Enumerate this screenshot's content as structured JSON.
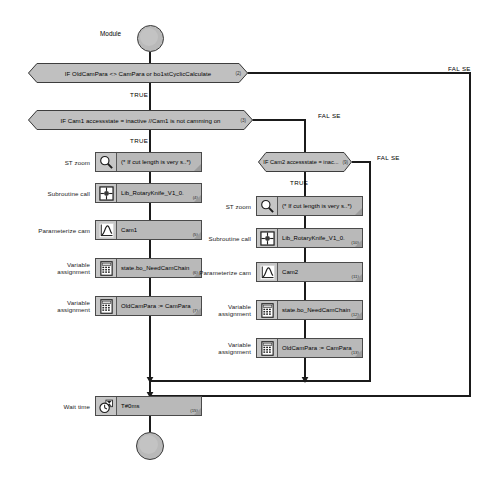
{
  "diagram": {
    "type": "plc-sequential-flowchart",
    "start": {
      "label": "Module",
      "node_name": "start-node"
    },
    "end": {
      "node_name": "end-node"
    },
    "decisions": [
      {
        "id": "d1",
        "text": "IF OldCamPara <> CamPara or bo1stCyclicCalculate",
        "badge": "(2)",
        "true_label": "TRUE",
        "false_label": "FAL SE"
      },
      {
        "id": "d2",
        "text": "IF Cam1 accessstate = inactive //Cam1 is not camming on",
        "badge": "(3)",
        "true_label": "TRUE",
        "false_label": "FAL SE"
      },
      {
        "id": "d3",
        "text": "IF Cam2 accessstate = inac...",
        "badge": "(9)",
        "true_label": "TRUE",
        "false_label": "FAL SE"
      }
    ],
    "left_branch": [
      {
        "label": "ST zoom",
        "icon": "magnifier-icon",
        "text": "(* If cut length is very s..*)",
        "badge": ""
      },
      {
        "label": "Subroutine call",
        "icon": "subroutine-icon",
        "text": "Lib_RotaryKnife_V1_0.",
        "badge": "(4)"
      },
      {
        "label": "Parameterize cam",
        "icon": "cam-curve-icon",
        "text": "Cam1",
        "badge": "(5)"
      },
      {
        "label": "Variable\nassignment",
        "icon": "calculator-icon",
        "text": "state.bo_NeedCamChain",
        "badge": "(6)"
      },
      {
        "label": "Variable\nassignment",
        "icon": "calculator-icon",
        "text": "OldCamPara := CamPara",
        "badge": "(7)"
      }
    ],
    "right_branch": [
      {
        "label": "ST zoom",
        "icon": "magnifier-icon",
        "text": "(* If cut length is very s..*)",
        "badge": ""
      },
      {
        "label": "Subroutine call",
        "icon": "subroutine-icon",
        "text": "Lib_RotaryKnife_V1_0.",
        "badge": "(10)"
      },
      {
        "label": "Parameterize cam",
        "icon": "cam-curve-icon",
        "text": "Cam2",
        "badge": "(11)"
      },
      {
        "label": "Variable\nassignment",
        "icon": "calculator-icon",
        "text": "state.bo_NeedCamChain",
        "badge": "(12)"
      },
      {
        "label": "Variable\nassignment",
        "icon": "calculator-icon",
        "text": "OldCamPara := CamPara",
        "badge": "(13)"
      }
    ],
    "wait": {
      "label": "Wait time",
      "icon": "clock-icon",
      "text": "T#0ms",
      "badge": "(15)"
    },
    "colors": {
      "block_fill": "#b9b9b9",
      "icon_fill": "#c6c6c6",
      "line": "#1b1b1b",
      "border": "#4a4a4a",
      "background": "#ffffff"
    }
  }
}
